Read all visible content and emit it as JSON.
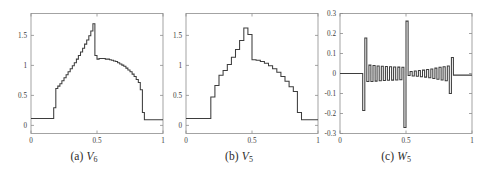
{
  "figure": {
    "name": "multiresolution-wavelet-decomposition",
    "background_color": "#ffffff",
    "line_color": "#3d3d3d",
    "axis_color": "#8d8d8d",
    "panel_count": 3
  },
  "panels": [
    {
      "id": "panel-a",
      "caption_prefix": "(a)",
      "caption_symbol": "V",
      "caption_subscript": "6",
      "caption_text": "(a) V6"
    },
    {
      "id": "panel-b",
      "caption_prefix": "(b)",
      "caption_symbol": "V",
      "caption_subscript": "5",
      "caption_text": "(b) V5"
    },
    {
      "id": "panel-c",
      "caption_prefix": "(c)",
      "caption_symbol": "W",
      "caption_subscript": "5",
      "caption_text": "(c) W5"
    }
  ],
  "chart_data": [
    {
      "type": "line",
      "title": "(a) V6",
      "xlabel": "",
      "ylabel": "",
      "xlim": [
        0,
        1
      ],
      "ylim": [
        -0.25,
        1.75
      ],
      "grid": false,
      "legend": "none",
      "xticks": [
        0,
        0.5,
        1
      ],
      "xtick_labels": [
        "0",
        "0.5",
        "1"
      ],
      "yticks": [
        0,
        0.5,
        1,
        1.5
      ],
      "ytick_labels": [
        "0",
        "0.5",
        "1",
        "1.5"
      ],
      "series": [
        {
          "name": "V6",
          "step": "post",
          "x": [
            0.0,
            0.016,
            0.031,
            0.047,
            0.063,
            0.078,
            0.094,
            0.109,
            0.125,
            0.141,
            0.156,
            0.172,
            0.188,
            0.203,
            0.219,
            0.234,
            0.25,
            0.266,
            0.281,
            0.297,
            0.313,
            0.328,
            0.344,
            0.359,
            0.375,
            0.391,
            0.406,
            0.422,
            0.438,
            0.453,
            0.469,
            0.484,
            0.5,
            0.516,
            0.531,
            0.547,
            0.563,
            0.578,
            0.594,
            0.609,
            0.625,
            0.641,
            0.656,
            0.672,
            0.688,
            0.703,
            0.719,
            0.734,
            0.75,
            0.766,
            0.781,
            0.797,
            0.813,
            0.828,
            0.844,
            0.859,
            0.875,
            0.891,
            0.906,
            0.922,
            0.938,
            0.953,
            0.969,
            0.984,
            1.0
          ],
          "y": [
            0.0,
            0.0,
            0.0,
            0.0,
            0.0,
            0.0,
            0.0,
            0.0,
            0.0,
            0.0,
            0.0,
            0.18,
            0.5,
            0.54,
            0.58,
            0.63,
            0.68,
            0.73,
            0.78,
            0.83,
            0.88,
            0.93,
            0.99,
            1.05,
            1.11,
            1.17,
            1.24,
            1.31,
            1.38,
            1.46,
            1.58,
            1.05,
            0.99,
            1.0,
            1.0,
            1.0,
            0.99,
            0.99,
            0.98,
            0.97,
            0.96,
            0.95,
            0.93,
            0.91,
            0.89,
            0.87,
            0.84,
            0.81,
            0.78,
            0.74,
            0.7,
            0.65,
            0.6,
            0.48,
            0.1,
            -0.02,
            -0.02,
            -0.02,
            -0.02,
            -0.02,
            -0.02,
            -0.02,
            -0.02,
            -0.02,
            -0.02
          ]
        }
      ]
    },
    {
      "type": "line",
      "title": "(b) V5",
      "xlabel": "",
      "ylabel": "",
      "xlim": [
        0,
        1
      ],
      "ylim": [
        -0.25,
        1.75
      ],
      "grid": false,
      "legend": "none",
      "xticks": [
        0,
        0.5,
        1
      ],
      "xtick_labels": [
        "0",
        "0.5",
        "1"
      ],
      "yticks": [
        0,
        0.5,
        1,
        1.5
      ],
      "ytick_labels": [
        "0",
        "0.5",
        "1",
        "1.5"
      ],
      "series": [
        {
          "name": "V5",
          "step": "post",
          "x": [
            0.0,
            0.031,
            0.063,
            0.094,
            0.125,
            0.156,
            0.188,
            0.219,
            0.25,
            0.281,
            0.313,
            0.344,
            0.375,
            0.406,
            0.438,
            0.469,
            0.5,
            0.531,
            0.563,
            0.594,
            0.625,
            0.656,
            0.688,
            0.719,
            0.75,
            0.781,
            0.813,
            0.844,
            0.875,
            0.906,
            0.938,
            0.969,
            1.0
          ],
          "y": [
            0.0,
            0.0,
            0.0,
            0.0,
            0.0,
            0.0,
            0.36,
            0.55,
            0.72,
            0.8,
            0.9,
            1.02,
            1.15,
            1.3,
            1.51,
            1.4,
            0.98,
            0.97,
            0.95,
            0.92,
            0.88,
            0.83,
            0.77,
            0.7,
            0.62,
            0.53,
            0.45,
            0.1,
            -0.02,
            -0.02,
            -0.02,
            -0.02,
            -0.02
          ]
        }
      ]
    },
    {
      "type": "line",
      "title": "(c) W5",
      "xlabel": "",
      "ylabel": "",
      "xlim": [
        0,
        1
      ],
      "ylim": [
        -0.3,
        0.3
      ],
      "grid": false,
      "legend": "none",
      "xticks": [
        0,
        0.5,
        1
      ],
      "xtick_labels": [
        "0",
        "0.5",
        "1"
      ],
      "yticks": [
        -0.3,
        -0.2,
        -0.1,
        0,
        0.1,
        0.2,
        0.3
      ],
      "ytick_labels": [
        "-0.3",
        "-0.2",
        "-0.1",
        "0",
        "0.1",
        "0.2",
        "0.3"
      ],
      "series": [
        {
          "name": "W5",
          "step": "post",
          "x": [
            0.0,
            0.016,
            0.031,
            0.047,
            0.063,
            0.078,
            0.094,
            0.109,
            0.125,
            0.141,
            0.156,
            0.172,
            0.188,
            0.203,
            0.219,
            0.234,
            0.25,
            0.266,
            0.281,
            0.297,
            0.313,
            0.328,
            0.344,
            0.359,
            0.375,
            0.391,
            0.406,
            0.422,
            0.438,
            0.453,
            0.469,
            0.484,
            0.5,
            0.516,
            0.531,
            0.547,
            0.563,
            0.578,
            0.594,
            0.609,
            0.625,
            0.641,
            0.656,
            0.672,
            0.688,
            0.703,
            0.719,
            0.734,
            0.75,
            0.766,
            0.781,
            0.797,
            0.813,
            0.828,
            0.844,
            0.859,
            0.875,
            0.891,
            0.906,
            0.922,
            0.938,
            0.953,
            0.969,
            0.984,
            1.0
          ],
          "y": [
            0.0,
            0.0,
            0.0,
            0.0,
            0.0,
            0.0,
            0.0,
            0.0,
            0.0,
            0.0,
            0.0,
            -0.185,
            0.178,
            -0.04,
            0.042,
            -0.04,
            0.04,
            -0.038,
            0.038,
            -0.036,
            0.036,
            -0.035,
            0.035,
            -0.034,
            0.034,
            -0.033,
            0.033,
            -0.032,
            0.032,
            -0.031,
            0.031,
            -0.27,
            0.262,
            -0.01,
            0.01,
            -0.012,
            0.013,
            -0.014,
            0.015,
            -0.016,
            0.017,
            -0.018,
            0.02,
            -0.021,
            0.023,
            -0.025,
            0.027,
            -0.029,
            0.031,
            -0.032,
            0.034,
            -0.036,
            0.038,
            -0.1,
            0.08,
            -0.008,
            -0.008,
            -0.008,
            -0.008,
            -0.008,
            -0.008,
            -0.008,
            -0.008,
            -0.008,
            -0.008
          ]
        }
      ]
    }
  ]
}
